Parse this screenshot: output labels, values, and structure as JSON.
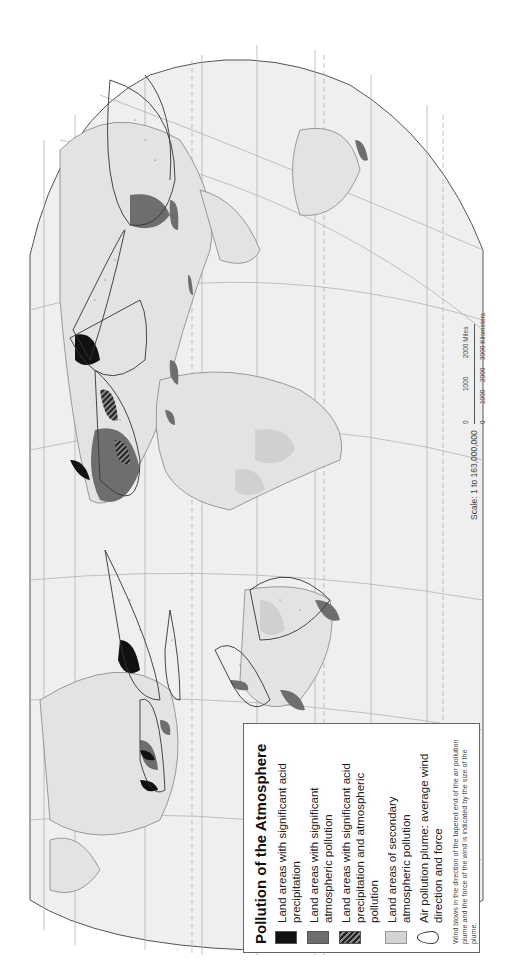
{
  "map": {
    "title": "Pollution of the Atmosphere",
    "orientation": "rotated 90 degrees counterclockwise",
    "colors": {
      "ocean": "#f2f2f2",
      "land": "#e6e6e6",
      "border": "#888888",
      "acid_precipitation": "#111111",
      "atmospheric_pollution": "#6e6e6e",
      "secondary_pollution": "#d4d4d4",
      "graticule": "#aaaaaa"
    },
    "legend": {
      "title": "Pollution of the Atmosphere",
      "items": [
        {
          "swatch": "black",
          "label": "Land areas with significant acid precipitation"
        },
        {
          "swatch": "dark-gray",
          "label": "Land areas with significant atmospheric pollution"
        },
        {
          "swatch": "hatched",
          "label": "Land areas with significant acid precipitation and atmospheric pollution"
        },
        {
          "swatch": "light-gray",
          "label": "Land areas of secondary atmospheric pollution"
        },
        {
          "swatch": "plume-outline",
          "label": "Air pollution plume: average wind direction and force"
        }
      ],
      "note": "Wind blows in the direction of the tapered end of the air pollution plume and the force of the wind is indicated by the size of the plume."
    },
    "scale": {
      "text": "Scale: 1 to 163,000,000",
      "miles_ticks": [
        "0",
        "1000",
        "2000 Miles"
      ],
      "km_ticks": [
        "0",
        "1000",
        "2000",
        "3000 Kilometers"
      ]
    }
  }
}
